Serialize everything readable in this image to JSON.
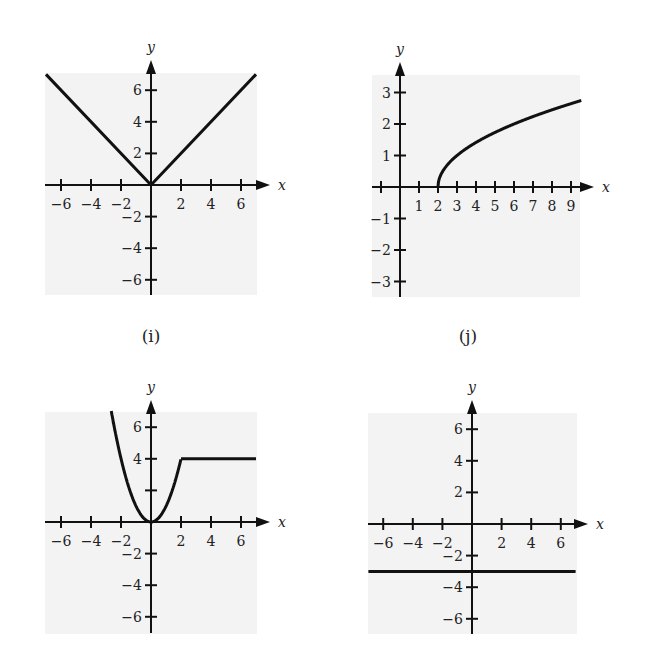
{
  "figure": {
    "captions": {
      "i": "(i)",
      "j": "(j)"
    },
    "axis_names": {
      "x": "x",
      "y": "y"
    }
  },
  "chart_data": [
    {
      "id": "top-left",
      "type": "line",
      "caption": "(i)",
      "description": "V-shaped graph y = |x|",
      "xlabel": "x",
      "ylabel": "y",
      "xlim": [
        -7,
        7
      ],
      "ylim": [
        -7,
        7
      ],
      "x_ticks": [
        -6,
        -4,
        -2,
        2,
        4,
        6
      ],
      "x_tick_labels": [
        "−6",
        "−4",
        "−2",
        "2",
        "4",
        "6"
      ],
      "y_ticks": [
        -6,
        -4,
        -2,
        2,
        4,
        6
      ],
      "y_tick_labels": [
        "−6",
        "−4",
        "−2",
        "2",
        "4",
        "6"
      ],
      "grid": false,
      "series": [
        {
          "name": "y = |x|",
          "x": [
            -7,
            0,
            7
          ],
          "y": [
            7,
            0,
            7
          ]
        }
      ]
    },
    {
      "id": "top-right",
      "type": "line",
      "caption": "(j)",
      "description": "Square-root curve y = sqrt(x − 2)",
      "xlabel": "x",
      "ylabel": "y",
      "xlim": [
        -1.5,
        9.5
      ],
      "ylim": [
        -3.5,
        3.5
      ],
      "x_ticks": [
        -1,
        1,
        2,
        3,
        4,
        5,
        6,
        7,
        8,
        9
      ],
      "x_tick_labels": [
        "",
        "1",
        "2",
        "3",
        "4",
        "5",
        "6",
        "7",
        "8",
        "9"
      ],
      "y_ticks": [
        -3,
        -2,
        -1,
        1,
        2,
        3
      ],
      "y_tick_labels": [
        "−3",
        "−2",
        "−1",
        "1",
        "2",
        "3"
      ],
      "grid": false,
      "series": [
        {
          "name": "y = sqrt(x − 2)",
          "x": [
            2,
            2.25,
            3,
            4,
            5,
            6,
            7,
            8,
            9,
            9.5
          ],
          "y": [
            0,
            0.5,
            1,
            1.41,
            1.73,
            2,
            2.24,
            2.45,
            2.65,
            2.74
          ]
        }
      ]
    },
    {
      "id": "bottom-left",
      "type": "line",
      "caption": "",
      "description": "Piecewise: y = x^2 for x ≤ 2, y = 4 for x > 2",
      "xlabel": "x",
      "ylabel": "y",
      "xlim": [
        -7,
        7
      ],
      "ylim": [
        -7,
        7
      ],
      "x_ticks": [
        -6,
        -4,
        -2,
        2,
        4,
        6
      ],
      "x_tick_labels": [
        "−6",
        "−4",
        "−2",
        "2",
        "4",
        "6"
      ],
      "y_ticks": [
        -6,
        -4,
        -2,
        2,
        4,
        6
      ],
      "y_tick_labels": [
        "−6",
        "−4",
        "−2",
        "",
        "4",
        "6"
      ],
      "grid": false,
      "series": [
        {
          "name": "y = x^2 (x ≤ 2)",
          "x": [
            -2.65,
            -2,
            -1,
            0,
            1,
            2
          ],
          "y": [
            7,
            4,
            1,
            0,
            1,
            4
          ]
        },
        {
          "name": "y = 4 (x > 2)",
          "x": [
            2,
            7
          ],
          "y": [
            4,
            4
          ]
        }
      ]
    },
    {
      "id": "bottom-right",
      "type": "line",
      "caption": "",
      "description": "Horizontal line y = −3",
      "xlabel": "x",
      "ylabel": "y",
      "xlim": [
        -7,
        7
      ],
      "ylim": [
        -7,
        7
      ],
      "x_ticks": [
        -6,
        -4,
        -2,
        2,
        4,
        6
      ],
      "x_tick_labels": [
        "−6",
        "−4",
        "−2",
        "2",
        "4",
        "6"
      ],
      "y_ticks": [
        -6,
        -4,
        -2,
        2,
        4,
        6
      ],
      "y_tick_labels": [
        "−6",
        "−4",
        "−2",
        "2",
        "4",
        "6"
      ],
      "grid": false,
      "series": [
        {
          "name": "y = −3",
          "x": [
            -7,
            7
          ],
          "y": [
            -3,
            -3
          ]
        }
      ]
    }
  ],
  "layout": {
    "panels": [
      {
        "id": "top-left",
        "bg": [
          45,
          73,
          212,
          222
        ],
        "origin": [
          151,
          185
        ],
        "sx": 15.0,
        "sy": 15.8,
        "arrow_x": 270,
        "arrow_y": 60,
        "y_bottom": 295
      },
      {
        "id": "top-right",
        "bg": [
          372,
          75,
          208,
          222
        ],
        "origin": [
          400,
          187
        ],
        "sx": 19.0,
        "sy": 31.5,
        "arrow_x": 594,
        "arrow_y": 62,
        "y_bottom": 297,
        "x_left": 372
      },
      {
        "id": "bottom-left",
        "bg": [
          45,
          412,
          212,
          222
        ],
        "origin": [
          151,
          522
        ],
        "sx": 15.0,
        "sy": 15.8,
        "arrow_x": 270,
        "arrow_y": 400,
        "y_bottom": 633
      },
      {
        "id": "bottom-right",
        "bg": [
          368,
          413,
          209,
          221
        ],
        "origin": [
          472,
          524
        ],
        "sx": 14.8,
        "sy": 15.8,
        "arrow_x": 588,
        "arrow_y": 400,
        "y_bottom": 634
      }
    ]
  }
}
